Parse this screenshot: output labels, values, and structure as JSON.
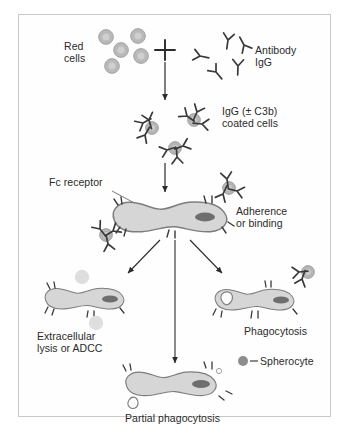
{
  "diagram": {
    "title_visible": false,
    "frame": {
      "border_color": "#c9c9c9",
      "background": "#fefefe"
    },
    "palette": {
      "cell_fill": "#b9b9b9",
      "cell_center": "#cdcdcd",
      "cell_stroke": "#8f8f8f",
      "macrophage_fill": "#d6d6d6",
      "macrophage_stroke": "#7d7d7d",
      "nucleus_fill": "#6e6e6e",
      "antibody_stroke": "#3a3a3a",
      "arrow_color": "#2b2b2b",
      "text_color": "#2a2a2a",
      "faded_cell": "#dcdcdc"
    },
    "labels": {
      "red_cells": "Red\ncells",
      "plus_sign": "+",
      "antibody": "Antibody\nIgG",
      "coated_cells": "IgG (± C3b)\ncoated cells",
      "fc_receptor": "Fc receptor",
      "adherence": "Adherence\nor binding",
      "extracellular": "Extracellular\nlysis or ADCC",
      "phagocytosis": "Phagocytosis",
      "spherocyte": "Spherocyte",
      "partial_phagocytosis": "Partial phagocytosis"
    },
    "stages": [
      {
        "name": "red-cells-and-antibody",
        "count_red_cells": 5,
        "count_antibodies": 5
      },
      {
        "name": "igg-coated-cells",
        "count_coated_cells": 3
      },
      {
        "name": "adherence-binding",
        "count_attached_cells": 2
      },
      {
        "name": "extracellular-lysis-adcc",
        "count_faded_cells": 2
      },
      {
        "name": "phagocytosis",
        "has_vacuole": true,
        "count_attached_cells": 1
      },
      {
        "name": "partial-phagocytosis",
        "has_spherocyte_bud": true
      }
    ]
  }
}
